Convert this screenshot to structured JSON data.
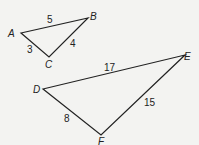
{
  "triangle_abc": {
    "vertices": {
      "A": "A",
      "B": "B",
      "C": "C"
    },
    "sides": {
      "AB": "5",
      "BC": "4",
      "AC": "3"
    }
  },
  "triangle_def": {
    "vertices": {
      "D": "D",
      "E": "E",
      "F": "F"
    },
    "sides": {
      "DE": "17",
      "EF": "15",
      "DF": "8"
    }
  },
  "colors": {
    "line": "#222222",
    "background": "#f3f3f1"
  }
}
